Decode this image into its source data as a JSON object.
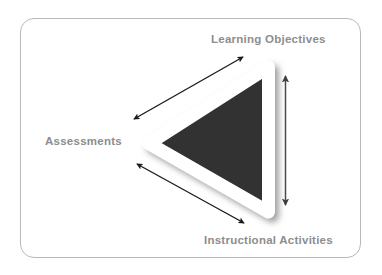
{
  "diagram": {
    "background_color": "#ffffff",
    "frame": {
      "border_color": "#b9b9b9",
      "corner_radius": "14px",
      "fill": "#ffffff"
    },
    "shape": {
      "name": "triangle",
      "orientation": "pointing-left",
      "fill_color": "#303030",
      "outline_color": "#ffffff",
      "shadow_color": "#9a9a9a"
    },
    "labels": [
      {
        "id": "learning-objectives",
        "text": "Learning Objectives",
        "position": "top-right",
        "color": "#8d8d8d"
      },
      {
        "id": "assessments",
        "text": "Assessments",
        "position": "left",
        "color": "#8d8d8d"
      },
      {
        "id": "instructional-activities",
        "text": "Instructional Activities",
        "position": "bottom-right",
        "color": "#8d8d8d"
      }
    ],
    "connectors": [
      {
        "id": "assessments-to-learning-objectives",
        "style": "double-headed-arrow",
        "color": "#1a1a1a",
        "from": "Assessments",
        "to": "Learning Objectives"
      },
      {
        "id": "assessments-to-instructional-activities",
        "style": "double-headed-arrow",
        "color": "#1a1a1a",
        "from": "Assessments",
        "to": "Instructional Activities"
      },
      {
        "id": "learning-objectives-to-instructional-activities",
        "style": "double-headed-arrow",
        "color": "#4a4a4a",
        "from": "Learning Objectives",
        "to": "Instructional Activities"
      }
    ]
  }
}
